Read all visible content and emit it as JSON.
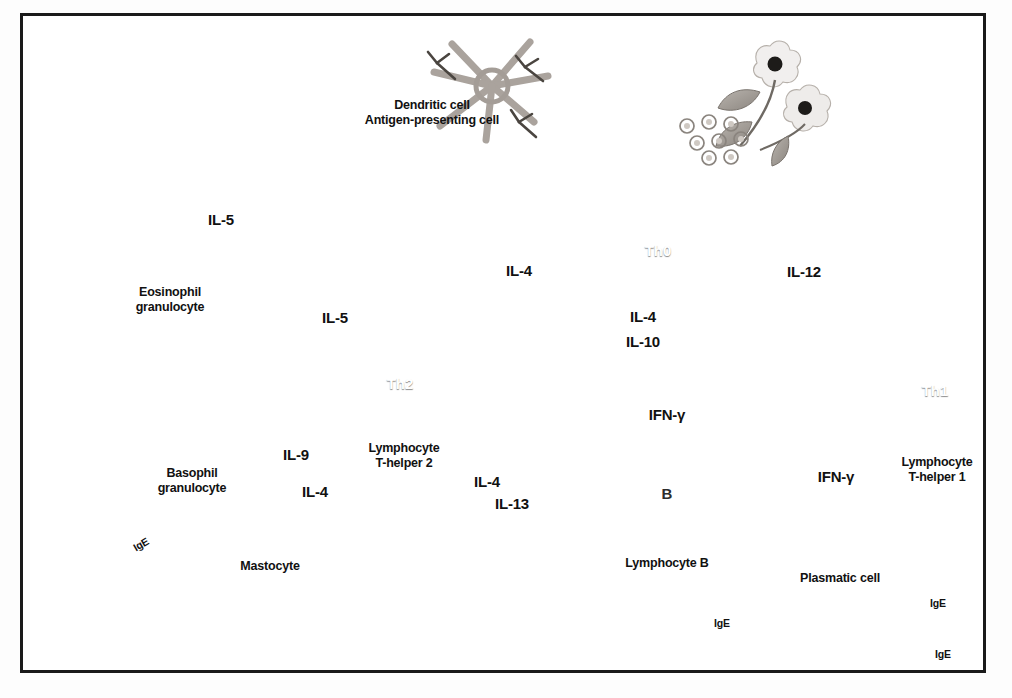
{
  "figure": {
    "border_color": "#1a1a1a",
    "background": "#ffffff"
  },
  "cells": [
    {
      "id": "allergen",
      "tag": "",
      "label": "",
      "x": 745,
      "y": 85,
      "kind": "flower-pollen"
    },
    {
      "id": "dendritic",
      "tag": "",
      "label": "Dendritic cell\nAntigen-presenting cell",
      "label_x": 432,
      "label_y": 105,
      "x": 490,
      "y": 80,
      "kind": "dendritic"
    },
    {
      "id": "th0",
      "tag": "Th0",
      "label": "",
      "x": 658,
      "y": 250,
      "kind": "t-lymphocyte"
    },
    {
      "id": "th2",
      "tag": "Th2",
      "label": "Lymphocyte\nT-helper 2",
      "label_x": 404,
      "label_y": 448,
      "x": 400,
      "y": 383,
      "kind": "t-lymphocyte"
    },
    {
      "id": "th1",
      "tag": "Th1",
      "label": "Lymphocyte\nT-helper 1",
      "label_x": 937,
      "label_y": 462,
      "x": 935,
      "y": 390,
      "kind": "t-lymphocyte"
    },
    {
      "id": "bcell",
      "tag": "B",
      "label": "Lymphocyte B",
      "label_x": 667,
      "label_y": 562,
      "x": 670,
      "y": 497,
      "kind": "b-lymphocyte"
    },
    {
      "id": "plasmatic",
      "tag": "",
      "label": "Plasmatic cell",
      "label_x": 840,
      "label_y": 578,
      "x": 845,
      "y": 630,
      "kind": "plasma-cell"
    },
    {
      "id": "eosinophil",
      "tag": "",
      "label": "Eosinophil\ngranulocyte",
      "label_x": 170,
      "label_y": 292,
      "x": 250,
      "y": 292,
      "kind": "eosinophil"
    },
    {
      "id": "eos_degran",
      "tag": "",
      "label": "",
      "x": 135,
      "y": 193,
      "kind": "eosinophil-degranulating"
    },
    {
      "id": "mastocyte",
      "tag": "",
      "label": "Mastocyte",
      "label_x": 270,
      "label_y": 566,
      "x": 247,
      "y": 512,
      "kind": "mastocyte"
    },
    {
      "id": "basophil",
      "tag": "",
      "label": "Basophil\ngranulocyte",
      "label_x": 192,
      "label_y": 473,
      "x": 0,
      "y": 0,
      "kind": "label-only"
    },
    {
      "id": "mast_degran",
      "tag": "",
      "label": "",
      "x": 92,
      "y": 592,
      "kind": "mastocyte-degranulating"
    }
  ],
  "cytokine_labels": [
    {
      "text": "IL-5",
      "x": 221,
      "y": 220
    },
    {
      "text": "IL-5",
      "x": 335,
      "y": 318
    },
    {
      "text": "IL-4",
      "x": 519,
      "y": 271
    },
    {
      "text": "IL-4",
      "x": 643,
      "y": 317
    },
    {
      "text": "IL-10",
      "x": 643,
      "y": 342
    },
    {
      "text": "IL-12",
      "x": 804,
      "y": 272
    },
    {
      "text": "IFN-γ",
      "x": 667,
      "y": 415
    },
    {
      "text": "IFN-γ",
      "x": 836,
      "y": 477
    },
    {
      "text": "IL-9",
      "x": 296,
      "y": 455
    },
    {
      "text": "IL-4",
      "x": 315,
      "y": 492
    },
    {
      "text": "IL-4",
      "x": 487,
      "y": 482
    },
    {
      "text": "IL-13",
      "x": 512,
      "y": 504
    }
  ],
  "antibody_labels": [
    {
      "text": "IgE",
      "x": 140,
      "y": 545,
      "rot": -30
    },
    {
      "text": "IgE",
      "x": 722,
      "y": 624,
      "rot": 0
    },
    {
      "text": "IgE",
      "x": 938,
      "y": 604,
      "rot": 0
    },
    {
      "text": "IgE",
      "x": 943,
      "y": 655,
      "rot": 0
    }
  ],
  "inhibition_symbols": [
    {
      "id": "inh-th1-block",
      "x": 798,
      "y": 351
    },
    {
      "id": "inh-th2-block",
      "x": 522,
      "y": 414
    },
    {
      "id": "inh-bcell-block",
      "x": 784,
      "y": 495
    }
  ],
  "arrows": [
    {
      "id": "allergen-to-dendritic",
      "label": "",
      "weight": "thick"
    },
    {
      "id": "dendritic-to-th0",
      "label": "",
      "weight": "thick"
    },
    {
      "id": "th0-to-dendritic",
      "label": "",
      "weight": "thick"
    },
    {
      "id": "th0-to-th2",
      "label": "IL-4",
      "weight": "thick"
    },
    {
      "id": "th0-to-th1",
      "label": "IL-12",
      "weight": "thin"
    },
    {
      "id": "th2-inhibits-th1",
      "label": "IL-4, IL-10",
      "weight": "thick"
    },
    {
      "id": "th1-inhibits-th2",
      "label": "IFN-γ",
      "weight": "thin"
    },
    {
      "id": "th2-to-eosinophil",
      "label": "IL-5",
      "weight": "thick"
    },
    {
      "id": "eosinophil-to-degran",
      "label": "IL-5",
      "weight": "thick"
    },
    {
      "id": "th2-to-mastocyte",
      "label": "IL-9",
      "weight": "thick"
    },
    {
      "id": "mastocyte-to-th2",
      "label": "IL-4",
      "weight": "thick"
    },
    {
      "id": "th2-to-bcell",
      "label": "IL-4, IL-13",
      "weight": "thick"
    },
    {
      "id": "th1-inhibits-bcell",
      "label": "IFN-γ",
      "weight": "thin"
    },
    {
      "id": "bcell-to-plasmatic",
      "label": "",
      "weight": "thick"
    },
    {
      "id": "mastocyte-to-degran",
      "label": "",
      "weight": "thick"
    }
  ]
}
